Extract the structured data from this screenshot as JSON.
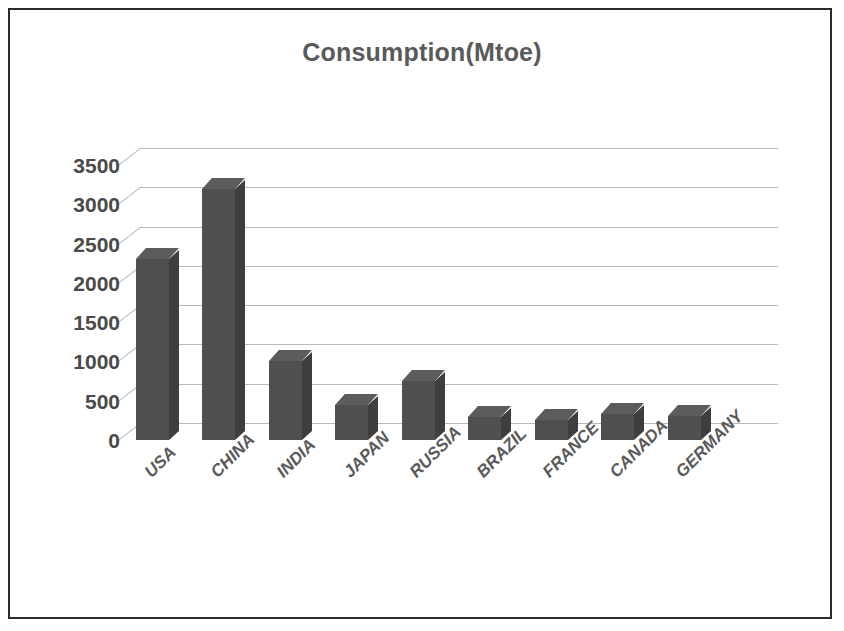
{
  "frame": {
    "border_color": "#2b2b2b",
    "background": "#ffffff"
  },
  "chart_data": {
    "type": "bar",
    "title": "Consumption(Mtoe)",
    "subtitle": "",
    "xlabel": "",
    "ylabel": "",
    "ylim": [
      0,
      3500
    ],
    "ytick_step": 500,
    "grid": true,
    "legend": false,
    "legend_position": "none",
    "style": "3d-column",
    "bar_color": "#4f4f4f",
    "gridline_color": "#b9b9b9",
    "text_color": "#5a5a5a",
    "categories": [
      "USA",
      "CHINA",
      "INDIA",
      "JAPAN",
      "RUSSIA",
      "BRAZIL",
      "FRANCE",
      "CANADA",
      "GERMANY"
    ],
    "values": [
      2300,
      3200,
      1000,
      450,
      750,
      290,
      250,
      330,
      310
    ],
    "ytick_labels": [
      "3500",
      "3000",
      "2500",
      "2000",
      "1500",
      "1000",
      "500",
      "0"
    ],
    "ytick_values": [
      3500,
      3000,
      2500,
      2000,
      1500,
      1000,
      500,
      0
    ]
  }
}
